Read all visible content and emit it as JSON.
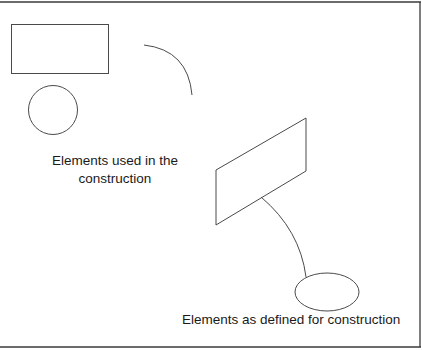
{
  "diagram": {
    "colors": {
      "background": "#ffffff",
      "stroke": "#4a4a4a",
      "frame": "#3a3a3a",
      "text": "#1a1a1a"
    },
    "labels": {
      "used_line1": "Elements used in the",
      "used_line2": "construction",
      "defined": "Elements as defined for construction"
    },
    "groups": [
      {
        "name": "Elements used in the construction",
        "shapes": [
          "rectangle",
          "circle",
          "arc"
        ]
      },
      {
        "name": "Elements as defined for construction",
        "shapes": [
          "parallelogram (rectangle in perspective)",
          "curve",
          "ellipse (circle in perspective)"
        ]
      }
    ]
  }
}
